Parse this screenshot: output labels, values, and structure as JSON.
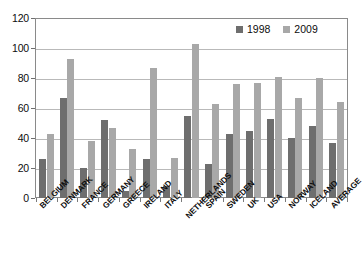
{
  "chart_data": {
    "type": "bar",
    "title": "",
    "subtitle": "",
    "xlabel": "",
    "ylabel": "",
    "ylim": [
      0,
      120
    ],
    "yticks": [
      0,
      20,
      40,
      60,
      80,
      100,
      120
    ],
    "grid": true,
    "legend_position": "top-right",
    "categories": [
      "BELGIUM",
      "DENMARK",
      "FRANCE",
      "GERMANY",
      "GREECE",
      "IRELAND",
      "ITALY",
      "NETHERLANDS",
      "SPAIN",
      "SWEDEN",
      "UK",
      "USA",
      "NORWAY",
      "ICELAND",
      "AVERAGE"
    ],
    "series": [
      {
        "name": "1998",
        "color": "#6e6e6e",
        "values": [
          26,
          67,
          20,
          52,
          5,
          26,
          8,
          55,
          23,
          43,
          45,
          53,
          40,
          48,
          37
        ]
      },
      {
        "name": "2009",
        "color": "#a8a8a8",
        "values": [
          43,
          93,
          38,
          47,
          33,
          87,
          27,
          103,
          63,
          76,
          77,
          81,
          67,
          80,
          64
        ]
      }
    ]
  },
  "legend": {
    "items": [
      {
        "label": "1998",
        "color": "#6e6e6e"
      },
      {
        "label": "2009",
        "color": "#a8a8a8"
      }
    ]
  },
  "axis": {
    "y_tick_labels": [
      "120",
      "100",
      "80",
      "60",
      "40",
      "20",
      "0"
    ]
  }
}
